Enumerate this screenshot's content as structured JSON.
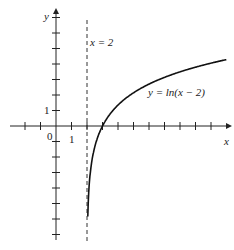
{
  "chart_data": {
    "type": "line",
    "title": "",
    "xlabel": "x",
    "ylabel": "y",
    "series": [
      {
        "name": "y = ln(x − 2)",
        "function": "ln(x-2)",
        "x": [
          2.05,
          2.1,
          2.25,
          2.5,
          3,
          4,
          5,
          6,
          7,
          8,
          9,
          10
        ],
        "y": [
          -3.0,
          -2.3,
          -1.39,
          -0.69,
          0,
          0.69,
          1.1,
          1.39,
          1.61,
          1.79,
          1.95,
          2.08
        ]
      }
    ],
    "asymptote": {
      "label": "x = 2",
      "x": 2,
      "style": "dashed"
    },
    "tick_labels": {
      "origin": "0",
      "x1": "1",
      "y1": "1"
    },
    "xlim": [
      -3,
      11
    ],
    "ylim": [
      -7,
      7
    ],
    "grid": false
  },
  "labels": {
    "x_axis": "x",
    "y_axis": "y",
    "origin": "0",
    "x_one": "1",
    "y_one": "1",
    "asymptote": "x = 2",
    "curve": "y = ln(x − 2)"
  }
}
